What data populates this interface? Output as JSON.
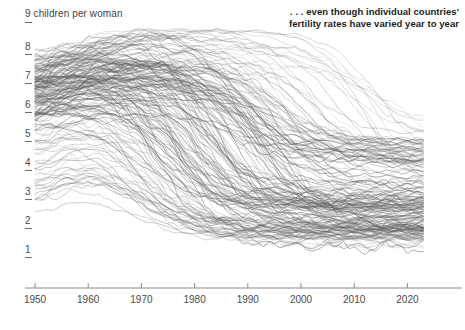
{
  "chart_data": {
    "type": "line",
    "title": ". . . even though individual countries' fertility rates have varied year to year",
    "title_line1": ". . . even though individual countries'",
    "title_line2": "fertility rates have varied year to year",
    "ylabel": "9 children per woman",
    "xlabel": "",
    "axis_unit_note": "9 children per woman",
    "xlim": [
      1950,
      2023
    ],
    "ylim": [
      0.6,
      9.2
    ],
    "grid": false,
    "legend": "none",
    "yticks": [
      8,
      7,
      6,
      5,
      4,
      3,
      2,
      1
    ],
    "ytick_labels": [
      "8",
      "7",
      "6",
      "5",
      "4",
      "3",
      "2",
      "1"
    ],
    "xticks": [
      1950,
      1960,
      1970,
      1980,
      1990,
      2000,
      2010,
      2020
    ],
    "xtick_labels": [
      "1950",
      "1960",
      "1970",
      "1980",
      "1990",
      "2000",
      "2010",
      "2020"
    ],
    "line_color": "#5a5a5a",
    "line_opacity": 0.45,
    "axis_color": "#8a8a8a",
    "text_color": "#4a4a4a",
    "title_color": "#1c1c1c",
    "background": "#ffffff",
    "series_count": 185,
    "x": [
      1950,
      1955,
      1960,
      1965,
      1970,
      1975,
      1980,
      1985,
      1990,
      1995,
      2000,
      2005,
      2010,
      2015,
      2020,
      2023
    ],
    "series": [
      {
        "name": "country-001",
        "values": [
          7.5,
          7.6,
          7.7,
          7.8,
          7.9,
          7.9,
          7.8,
          7.7,
          7.5,
          7.1,
          6.6,
          6.0,
          5.4,
          4.9,
          4.5,
          4.3
        ]
      },
      {
        "name": "country-002",
        "values": [
          6.9,
          7.0,
          7.2,
          7.4,
          7.5,
          7.6,
          7.6,
          7.5,
          7.2,
          6.8,
          6.3,
          5.7,
          5.1,
          4.6,
          4.2,
          4.0
        ]
      },
      {
        "name": "country-003",
        "values": [
          6.2,
          6.3,
          6.4,
          6.6,
          6.8,
          7.1,
          7.3,
          7.4,
          7.3,
          7.0,
          6.5,
          5.9,
          5.3,
          4.8,
          4.4,
          4.2
        ]
      },
      {
        "name": "country-004",
        "values": [
          6.6,
          6.7,
          6.7,
          6.8,
          6.9,
          6.9,
          6.8,
          6.6,
          6.3,
          5.9,
          5.4,
          4.9,
          4.4,
          4.0,
          3.7,
          3.6
        ]
      },
      {
        "name": "country-005",
        "values": [
          7.2,
          7.2,
          7.1,
          7.0,
          6.8,
          6.6,
          6.3,
          6.0,
          5.6,
          5.2,
          4.7,
          4.2,
          3.8,
          3.5,
          3.2,
          3.1
        ]
      },
      {
        "name": "country-006",
        "values": [
          6.0,
          6.1,
          6.2,
          6.2,
          6.1,
          5.9,
          5.6,
          5.2,
          4.8,
          4.3,
          3.9,
          3.5,
          3.2,
          3.0,
          2.8,
          2.7
        ]
      },
      {
        "name": "country-007",
        "values": [
          6.5,
          6.6,
          6.6,
          6.5,
          6.3,
          6.0,
          5.6,
          5.1,
          4.6,
          4.1,
          3.6,
          3.2,
          2.9,
          2.7,
          2.5,
          2.4
        ]
      },
      {
        "name": "country-008",
        "values": [
          5.8,
          5.9,
          6.0,
          6.0,
          5.9,
          5.7,
          5.3,
          4.8,
          4.3,
          3.8,
          3.4,
          3.0,
          2.7,
          2.5,
          2.3,
          2.3
        ]
      },
      {
        "name": "country-009",
        "values": [
          6.8,
          6.9,
          6.9,
          6.8,
          6.5,
          6.0,
          5.4,
          4.7,
          4.0,
          3.4,
          2.9,
          2.5,
          2.3,
          2.1,
          2.0,
          2.0
        ]
      },
      {
        "name": "country-010",
        "values": [
          6.1,
          6.2,
          6.1,
          5.9,
          5.5,
          5.0,
          4.4,
          3.8,
          3.3,
          2.9,
          2.6,
          2.3,
          2.1,
          2.0,
          1.9,
          1.9
        ]
      },
      {
        "name": "country-011",
        "values": [
          5.5,
          5.6,
          5.6,
          5.5,
          5.2,
          4.7,
          4.1,
          3.5,
          3.0,
          2.6,
          2.3,
          2.1,
          2.0,
          1.9,
          1.8,
          1.8
        ]
      },
      {
        "name": "country-012",
        "values": [
          5.9,
          6.0,
          5.9,
          5.6,
          5.0,
          4.3,
          3.5,
          2.9,
          2.5,
          2.2,
          2.0,
          1.9,
          1.8,
          1.7,
          1.6,
          1.6
        ]
      },
      {
        "name": "country-013",
        "values": [
          6.4,
          6.2,
          5.8,
          5.3,
          4.7,
          4.0,
          3.3,
          2.7,
          2.3,
          2.0,
          1.8,
          1.7,
          1.6,
          1.6,
          1.5,
          1.5
        ]
      },
      {
        "name": "country-014",
        "values": [
          5.2,
          5.3,
          5.2,
          4.9,
          4.4,
          3.8,
          3.2,
          2.7,
          2.3,
          2.1,
          1.9,
          1.8,
          1.8,
          1.7,
          1.6,
          1.6
        ]
      },
      {
        "name": "country-015",
        "values": [
          4.6,
          4.7,
          4.6,
          4.3,
          3.9,
          3.4,
          2.9,
          2.5,
          2.2,
          2.0,
          1.9,
          1.8,
          1.8,
          1.7,
          1.7,
          1.6
        ]
      },
      {
        "name": "country-016",
        "values": [
          3.5,
          3.6,
          3.5,
          3.2,
          2.8,
          2.4,
          2.1,
          1.9,
          1.8,
          1.7,
          1.7,
          1.7,
          1.8,
          1.8,
          1.7,
          1.6
        ]
      },
      {
        "name": "country-017",
        "values": [
          2.9,
          3.2,
          3.4,
          3.1,
          2.6,
          2.1,
          1.9,
          1.8,
          1.8,
          1.8,
          1.8,
          1.9,
          1.9,
          1.8,
          1.7,
          1.6
        ]
      },
      {
        "name": "country-018",
        "values": [
          3.1,
          3.3,
          3.2,
          2.9,
          2.5,
          2.2,
          2.0,
          1.9,
          1.9,
          1.9,
          2.0,
          2.0,
          2.0,
          1.9,
          1.8,
          1.7
        ]
      },
      {
        "name": "country-019",
        "values": [
          2.6,
          2.7,
          2.6,
          2.5,
          2.3,
          1.9,
          1.7,
          1.6,
          1.5,
          1.4,
          1.3,
          1.3,
          1.4,
          1.5,
          1.4,
          1.4
        ]
      },
      {
        "name": "country-020",
        "values": [
          5.4,
          5.8,
          6.0,
          6.0,
          5.7,
          5.2,
          4.6,
          4.0,
          3.5,
          3.0,
          2.7,
          2.4,
          2.2,
          2.1,
          2.0,
          1.9
        ]
      },
      {
        "name": "country-021",
        "values": [
          6.1,
          5.9,
          5.5,
          6.1,
          5.7,
          3.6,
          2.7,
          2.5,
          2.3,
          1.8,
          1.6,
          1.6,
          1.7,
          1.7,
          1.3,
          1.1
        ]
      },
      {
        "name": "country-022",
        "values": [
          7.8,
          7.9,
          8.0,
          8.1,
          8.2,
          8.1,
          7.9,
          7.7,
          7.4,
          7.0,
          6.6,
          6.2,
          5.8,
          5.4,
          5.0,
          4.8
        ]
      },
      {
        "name": "country-023",
        "values": [
          7.0,
          7.2,
          7.4,
          7.6,
          7.7,
          7.8,
          7.8,
          7.9,
          7.8,
          7.6,
          7.2,
          6.7,
          6.1,
          5.6,
          5.1,
          4.9
        ]
      },
      {
        "name": "country-024",
        "values": [
          6.3,
          6.4,
          6.5,
          6.7,
          6.9,
          7.0,
          7.1,
          7.1,
          6.9,
          6.6,
          6.2,
          5.7,
          5.2,
          4.7,
          4.3,
          4.1
        ]
      }
    ]
  },
  "axes": {
    "y_unit_label": "9 children per woman",
    "y_labels": [
      "8",
      "7",
      "6",
      "5",
      "4",
      "3",
      "2",
      "1"
    ],
    "x_labels": [
      "1950",
      "1960",
      "1970",
      "1980",
      "1990",
      "2000",
      "2010",
      "2020"
    ]
  }
}
